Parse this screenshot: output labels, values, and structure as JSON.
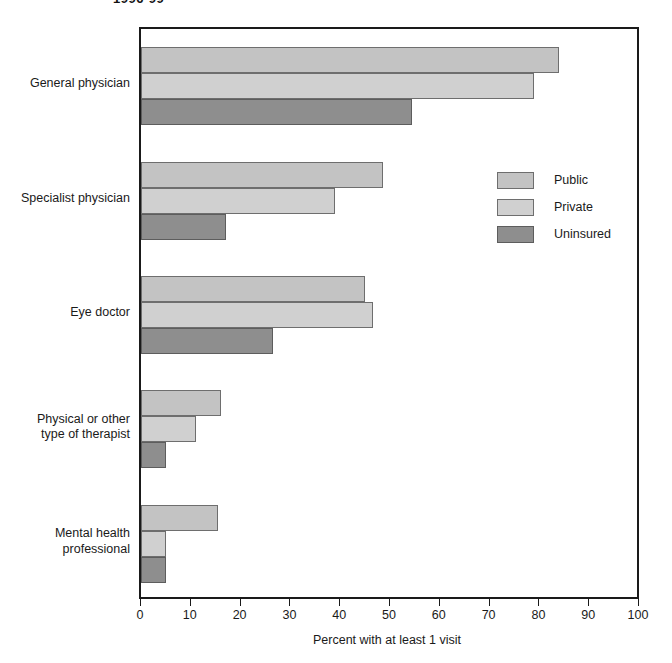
{
  "chart_title": "1996-99",
  "chart_data": {
    "type": "bar",
    "orientation": "horizontal",
    "title": "1996-99",
    "xlabel": "Percent with at least 1 visit",
    "ylabel": "",
    "xlim": [
      0,
      100
    ],
    "xticks": [
      0,
      10,
      20,
      30,
      40,
      50,
      60,
      70,
      80,
      90,
      100
    ],
    "grid": false,
    "legend_position": "inside-right",
    "categories": [
      "General physician",
      "Specialist physician",
      "Eye doctor",
      "Physical or other type of therapist",
      "Mental health professional"
    ],
    "series": [
      {
        "name": "Public",
        "color": "#c3c3c3",
        "values": [
          84,
          48.5,
          45,
          16,
          15.5
        ]
      },
      {
        "name": "Private",
        "color": "#d0d0d0",
        "values": [
          79,
          39,
          46.5,
          11,
          5
        ]
      },
      {
        "name": "Uninsured",
        "color": "#8e8e8e",
        "values": [
          54.5,
          17,
          26.5,
          5,
          5
        ]
      }
    ]
  },
  "category_labels": [
    {
      "line1": "General physician",
      "line2": ""
    },
    {
      "line1": "Specialist physician",
      "line2": ""
    },
    {
      "line1": "Eye doctor",
      "line2": ""
    },
    {
      "line1": "Physical or other",
      "line2": "type of therapist"
    },
    {
      "line1": "Mental health",
      "line2": "professional"
    }
  ],
  "legend": {
    "items": [
      {
        "label": "Public",
        "color": "#c3c3c3"
      },
      {
        "label": "Private",
        "color": "#d0d0d0"
      },
      {
        "label": "Uninsured",
        "color": "#8e8e8e"
      }
    ]
  },
  "axis": {
    "x_title": "Percent with at least 1 visit",
    "x_ticks": [
      "0",
      "10",
      "20",
      "30",
      "40",
      "50",
      "60",
      "70",
      "80",
      "90",
      "100"
    ]
  }
}
